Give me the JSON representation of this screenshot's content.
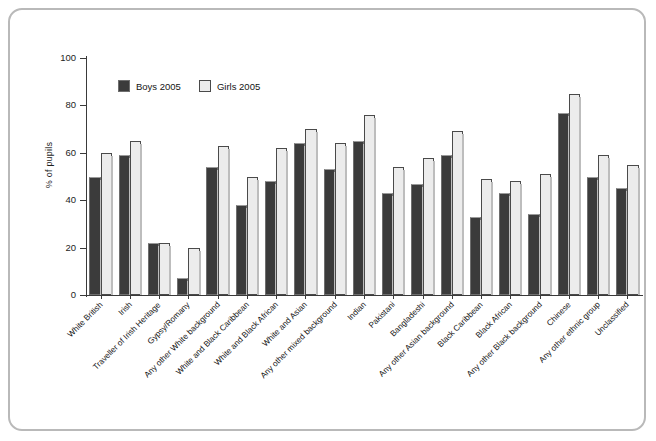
{
  "chart_data": {
    "type": "bar",
    "title": "",
    "xlabel": "",
    "ylabel": "% of pupils",
    "ylim": [
      0,
      100
    ],
    "yticks": [
      0,
      20,
      40,
      60,
      80,
      100
    ],
    "grid": false,
    "legend_position": "top-left inside",
    "categories": [
      "White British",
      "Irish",
      "Traveller of Irish Heritage",
      "Gypsy/Romany",
      "Any other White background",
      "White and Black Caribbean",
      "White and Black African",
      "White and Asian",
      "Any other mixed background",
      "Indian",
      "Pakistani",
      "Bangladeshi",
      "Any other Asian background",
      "Black Caribbean",
      "Black African",
      "Any other Black background",
      "Chinese",
      "Any other ethnic group",
      "Unclassified"
    ],
    "series": [
      {
        "name": "Boys 2005",
        "color": "#3b3b3b",
        "values": [
          50,
          59,
          22,
          7,
          54,
          38,
          48,
          64,
          53,
          65,
          43,
          47,
          59,
          33,
          43,
          34,
          77,
          50,
          45
        ]
      },
      {
        "name": "Girls 2005",
        "color": "#ececec",
        "values": [
          60,
          65,
          22,
          20,
          63,
          50,
          62,
          70,
          64,
          76,
          54,
          58,
          69,
          49,
          48,
          51,
          85,
          59,
          55
        ]
      }
    ]
  },
  "figure": {
    "frame_color": "#b9b9b9",
    "background": "#ffffff",
    "axis_color": "#3a3a3a"
  }
}
